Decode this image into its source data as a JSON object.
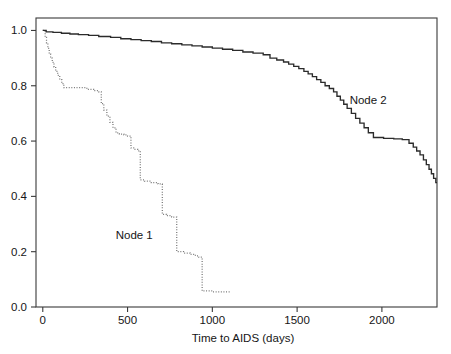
{
  "chart_data": {
    "type": "line",
    "title": "",
    "subtitle": "",
    "xlabel": "Time to AIDS (days)",
    "ylabel": "",
    "xlim": [
      -40,
      2325
    ],
    "ylim": [
      0.0,
      1.045
    ],
    "grid": false,
    "legend_position": "inline-annotation",
    "xticks": [
      0,
      500,
      1000,
      1500,
      2000
    ],
    "xticklabels": [
      "0",
      "500",
      "1000",
      "1500",
      "2000"
    ],
    "yticks": [
      0.0,
      0.2,
      0.4,
      0.6,
      0.8,
      1.0
    ],
    "yticklabels": [
      "0.0",
      "0.2",
      "0.4",
      "0.6",
      "0.8",
      "1.0"
    ],
    "annotations": [
      {
        "text": "Node 1",
        "x": 430,
        "y": 0.245
      },
      {
        "text": "Node 2",
        "x": 1810,
        "y": 0.735
      }
    ],
    "series": [
      {
        "name": "Node 1",
        "style": "dotted",
        "color": "#777777",
        "points": [
          [
            0,
            1.0
          ],
          [
            14,
            0.975
          ],
          [
            22,
            0.955
          ],
          [
            30,
            0.935
          ],
          [
            38,
            0.915
          ],
          [
            46,
            0.9
          ],
          [
            56,
            0.885
          ],
          [
            66,
            0.868
          ],
          [
            76,
            0.852
          ],
          [
            88,
            0.838
          ],
          [
            100,
            0.822
          ],
          [
            112,
            0.808
          ],
          [
            124,
            0.793
          ],
          [
            190,
            0.793
          ],
          [
            260,
            0.787
          ],
          [
            300,
            0.782
          ],
          [
            330,
            0.778
          ],
          [
            345,
            0.735
          ],
          [
            360,
            0.712
          ],
          [
            378,
            0.69
          ],
          [
            396,
            0.668
          ],
          [
            414,
            0.648
          ],
          [
            432,
            0.63
          ],
          [
            452,
            0.625
          ],
          [
            478,
            0.622
          ],
          [
            500,
            0.618
          ],
          [
            520,
            0.575
          ],
          [
            540,
            0.57
          ],
          [
            560,
            0.565
          ],
          [
            575,
            0.46
          ],
          [
            600,
            0.455
          ],
          [
            640,
            0.45
          ],
          [
            680,
            0.445
          ],
          [
            705,
            0.335
          ],
          [
            730,
            0.33
          ],
          [
            760,
            0.325
          ],
          [
            790,
            0.2
          ],
          [
            830,
            0.195
          ],
          [
            870,
            0.19
          ],
          [
            900,
            0.185
          ],
          [
            920,
            0.18
          ],
          [
            940,
            0.058
          ],
          [
            1000,
            0.055
          ],
          [
            1060,
            0.055
          ],
          [
            1110,
            0.055
          ]
        ]
      },
      {
        "name": "Node 2",
        "style": "solid",
        "color": "#2b2b2b",
        "points": [
          [
            0,
            1.0
          ],
          [
            20,
            0.995
          ],
          [
            60,
            0.993
          ],
          [
            110,
            0.99
          ],
          [
            160,
            0.987
          ],
          [
            210,
            0.985
          ],
          [
            270,
            0.982
          ],
          [
            330,
            0.978
          ],
          [
            400,
            0.975
          ],
          [
            460,
            0.97
          ],
          [
            520,
            0.967
          ],
          [
            580,
            0.963
          ],
          [
            640,
            0.96
          ],
          [
            700,
            0.955
          ],
          [
            760,
            0.952
          ],
          [
            820,
            0.948
          ],
          [
            880,
            0.944
          ],
          [
            940,
            0.94
          ],
          [
            1000,
            0.936
          ],
          [
            1060,
            0.932
          ],
          [
            1120,
            0.928
          ],
          [
            1180,
            0.922
          ],
          [
            1240,
            0.918
          ],
          [
            1300,
            0.912
          ],
          [
            1340,
            0.9
          ],
          [
            1380,
            0.893
          ],
          [
            1420,
            0.886
          ],
          [
            1450,
            0.878
          ],
          [
            1480,
            0.87
          ],
          [
            1510,
            0.862
          ],
          [
            1540,
            0.852
          ],
          [
            1565,
            0.843
          ],
          [
            1590,
            0.833
          ],
          [
            1615,
            0.822
          ],
          [
            1640,
            0.812
          ],
          [
            1665,
            0.8
          ],
          [
            1690,
            0.79
          ],
          [
            1715,
            0.778
          ],
          [
            1735,
            0.762
          ],
          [
            1755,
            0.748
          ],
          [
            1775,
            0.733
          ],
          [
            1795,
            0.718
          ],
          [
            1820,
            0.7
          ],
          [
            1845,
            0.682
          ],
          [
            1870,
            0.665
          ],
          [
            1895,
            0.648
          ],
          [
            1920,
            0.63
          ],
          [
            1950,
            0.613
          ],
          [
            2010,
            0.61
          ],
          [
            2070,
            0.608
          ],
          [
            2120,
            0.605
          ],
          [
            2160,
            0.592
          ],
          [
            2185,
            0.578
          ],
          [
            2205,
            0.564
          ],
          [
            2225,
            0.55
          ],
          [
            2245,
            0.532
          ],
          [
            2262,
            0.515
          ],
          [
            2278,
            0.498
          ],
          [
            2292,
            0.482
          ],
          [
            2305,
            0.465
          ],
          [
            2318,
            0.45
          ],
          [
            2325,
            0.45
          ]
        ]
      }
    ]
  }
}
